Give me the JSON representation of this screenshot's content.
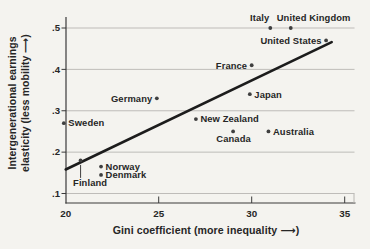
{
  "figure": {
    "background_color": "#f4f3ef"
  },
  "chart_data": {
    "type": "scatter",
    "title": "",
    "xlabel": "Gini coefficient (more inequality ⟶)",
    "ylabel_line1": "Intergenerational earnings",
    "ylabel_line2": "elasticity (less mobility ⟶)",
    "xlim": [
      20,
      35
    ],
    "ylim": [
      0.1,
      0.5
    ],
    "xtick_labels": [
      "20",
      "25",
      "30",
      "35"
    ],
    "xtick_values": [
      20,
      25,
      30,
      35
    ],
    "ytick_labels": [
      ".1",
      ".2",
      ".3",
      ".4",
      ".5"
    ],
    "ytick_values": [
      0.1,
      0.2,
      0.3,
      0.4,
      0.5
    ],
    "grid": "horizontal gridlines at each y tick",
    "legend": "none",
    "points": [
      {
        "label": "Sweden",
        "gini": 19.9,
        "elasticity": 0.27,
        "label_side": "right"
      },
      {
        "label": "Finland",
        "gini": 20.8,
        "elasticity": 0.18,
        "label_side": "below-leader"
      },
      {
        "label": "Norway",
        "gini": 21.9,
        "elasticity": 0.165,
        "label_side": "right"
      },
      {
        "label": "Denmark",
        "gini": 21.9,
        "elasticity": 0.145,
        "label_side": "right"
      },
      {
        "label": "Germany",
        "gini": 24.9,
        "elasticity": 0.33,
        "label_side": "left"
      },
      {
        "label": "New Zealand",
        "gini": 27.0,
        "elasticity": 0.28,
        "label_side": "right"
      },
      {
        "label": "Canada",
        "gini": 29.0,
        "elasticity": 0.25,
        "label_side": "below"
      },
      {
        "label": "France",
        "gini": 30.0,
        "elasticity": 0.41,
        "label_side": "left"
      },
      {
        "label": "Japan",
        "gini": 29.9,
        "elasticity": 0.34,
        "label_side": "right"
      },
      {
        "label": "Australia",
        "gini": 30.9,
        "elasticity": 0.25,
        "label_side": "right"
      },
      {
        "label": "Italy",
        "gini": 31.0,
        "elasticity": 0.5,
        "label_side": "above-left"
      },
      {
        "label": "United Kingdom",
        "gini": 32.1,
        "elasticity": 0.5,
        "label_side": "above-right"
      },
      {
        "label": "United States",
        "gini": 34.0,
        "elasticity": 0.47,
        "label_side": "left"
      }
    ],
    "trend_line": {
      "x_start": 20.0,
      "y_start": 0.158,
      "x_end": 34.3,
      "y_end": 0.466
    },
    "colors": {
      "point": "#3f3f3f",
      "trend_line": "#1c1c1c",
      "grid": "#b8b6b2",
      "axis": "#3a3a3a",
      "text": "#262626"
    }
  }
}
